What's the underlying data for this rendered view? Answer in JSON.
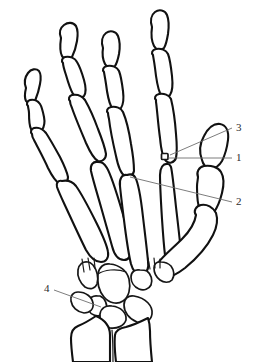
{
  "figure": {
    "background_color": "#ffffff",
    "line_color": "#111111",
    "leader_color": "#6e6e6e",
    "width": 257,
    "height": 362
  },
  "labels": [
    {
      "id": "label-3",
      "text": "3",
      "x": 236,
      "y": 122,
      "leader": {
        "x1": 232,
        "y1": 128,
        "x2": 170,
        "y2": 155
      }
    },
    {
      "id": "label-1",
      "text": "1",
      "x": 236,
      "y": 152,
      "leader": {
        "x1": 232,
        "y1": 158,
        "x2": 167,
        "y2": 158
      }
    },
    {
      "id": "label-2",
      "text": "2",
      "x": 236,
      "y": 196,
      "leader": {
        "x1": 232,
        "y1": 202,
        "x2": 130,
        "y2": 177
      }
    },
    {
      "id": "label-4",
      "text": "4",
      "x": 44,
      "y": 283,
      "leader": {
        "x1": 54,
        "y1": 290,
        "x2": 101,
        "y2": 307
      }
    }
  ],
  "bone_groups": [
    {
      "name": "distal-phalanges",
      "count": 5
    },
    {
      "name": "middle-phalanges",
      "count": 4
    },
    {
      "name": "proximal-phalanges",
      "count": 5
    },
    {
      "name": "metacarpals",
      "count": 5
    },
    {
      "name": "carpals",
      "count": 8
    },
    {
      "name": "sesamoid",
      "count": 1
    },
    {
      "name": "radius-ulna",
      "count": 2
    }
  ]
}
